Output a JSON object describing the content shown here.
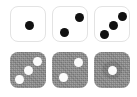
{
  "canvas": {
    "width": 137,
    "height": 97,
    "background": "#ffffff"
  },
  "palette": {
    "tile_light": "#ffffff",
    "tile_light_border": "#e3e3e3",
    "tile_dark": "#8a8a8a",
    "pip_black": "#111111",
    "pip_white": "#fbfbfb"
  },
  "grid": {
    "rows": 2,
    "columns": 3,
    "tile_size": 36,
    "column_x": [
      10,
      52,
      94
    ],
    "row_y": [
      6,
      52
    ]
  },
  "tiles": [
    {
      "id": "tile-r1c1",
      "row": 1,
      "column": 1,
      "style": "light",
      "pip_color": "black",
      "pip_count": 1,
      "x": 10,
      "y": 6,
      "halo": false,
      "pips": [
        {
          "cx": 18,
          "cy": 18
        }
      ]
    },
    {
      "id": "tile-r1c2",
      "row": 1,
      "column": 2,
      "style": "light",
      "pip_color": "black",
      "pip_count": 2,
      "x": 52,
      "y": 6,
      "halo": false,
      "pips": [
        {
          "cx": 26,
          "cy": 10
        },
        {
          "cx": 11,
          "cy": 25
        }
      ]
    },
    {
      "id": "tile-r1c3",
      "row": 1,
      "column": 3,
      "style": "light",
      "pip_color": "black",
      "pip_count": 3,
      "x": 94,
      "y": 6,
      "halo": false,
      "pips": [
        {
          "cx": 27,
          "cy": 9
        },
        {
          "cx": 18,
          "cy": 18
        },
        {
          "cx": 9,
          "cy": 27
        }
      ]
    },
    {
      "id": "tile-r2c1",
      "row": 2,
      "column": 1,
      "style": "dark",
      "pip_color": "white",
      "pip_count": 3,
      "x": 10,
      "y": 52,
      "halo": false,
      "pips": [
        {
          "cx": 27,
          "cy": 9
        },
        {
          "cx": 18,
          "cy": 18
        },
        {
          "cx": 9,
          "cy": 27
        }
      ]
    },
    {
      "id": "tile-r2c2",
      "row": 2,
      "column": 2,
      "style": "dark",
      "pip_color": "white",
      "pip_count": 2,
      "x": 52,
      "y": 52,
      "halo": false,
      "pips": [
        {
          "cx": 26,
          "cy": 10
        },
        {
          "cx": 11,
          "cy": 25
        }
      ]
    },
    {
      "id": "tile-r2c3",
      "row": 2,
      "column": 3,
      "style": "dark",
      "pip_color": "white",
      "pip_count": 1,
      "x": 94,
      "y": 52,
      "halo": true,
      "pips": [
        {
          "cx": 18,
          "cy": 18
        }
      ]
    }
  ]
}
